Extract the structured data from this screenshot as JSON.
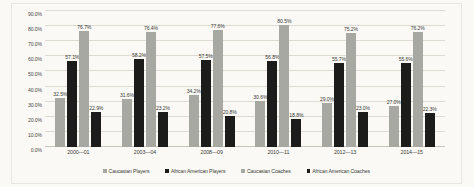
{
  "chart_data": {
    "type": "bar",
    "title": "",
    "subtitle": "",
    "xlabel": "",
    "ylabel": "",
    "ylim": [
      0,
      90
    ],
    "ytick_step": 10,
    "ytick_labels": [
      "0.0%",
      "10.0%",
      "20.0%",
      "30.0%",
      "40.0%",
      "50.0%",
      "60.0%",
      "70.0%",
      "80.0%",
      "90.0%"
    ],
    "ytick_values": [
      0,
      10,
      20,
      30,
      40,
      50,
      60,
      70,
      80,
      90
    ],
    "grid": true,
    "legend_position": "bottom",
    "categories": [
      "2000—01",
      "2003—04",
      "2008—09",
      "2010—11",
      "2012—13",
      "2014—15"
    ],
    "series": [
      {
        "name": "Caucasian Players",
        "color": "#a8a8a3",
        "values": [
          32.5,
          31.6,
          34.2,
          30.6,
          29.0,
          27.0
        ],
        "labels": [
          "32.5%",
          "31.6%",
          "34.2%",
          "30.6%",
          "29.0%",
          "27.0%"
        ]
      },
      {
        "name": "African American Players",
        "color": "#1c1c1a",
        "values": [
          57.1,
          58.2,
          57.5,
          56.8,
          55.7,
          55.6
        ],
        "labels": [
          "57.1%",
          "58.2%",
          "57.5%",
          "56.8%",
          "55.7%",
          "55.6%"
        ]
      },
      {
        "name": "Caucasian Coaches",
        "color": "#a8a8a3",
        "values": [
          76.7,
          76.4,
          77.6,
          80.5,
          75.2,
          76.2
        ],
        "labels": [
          "76.7%",
          "76.4%",
          "77.6%",
          "80.5%",
          "75.2%",
          "76.2%"
        ]
      },
      {
        "name": "African American Coaches",
        "color": "#1c1c1a",
        "values": [
          22.9,
          23.2,
          20.8,
          18.8,
          23.0,
          22.3
        ],
        "labels": [
          "22.9%",
          "23.2%",
          "20.8%",
          "18.8%",
          "23.0%",
          "22.3%"
        ]
      }
    ]
  },
  "colors": {
    "background": "#faf9f5",
    "gridline": "#dedbd2",
    "frame": "#e8e6df",
    "series_light": "#a8a8a3",
    "series_dark": "#1c1c1a",
    "text": "#3c3c39"
  }
}
